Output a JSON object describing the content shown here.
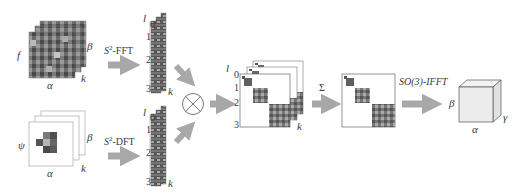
{
  "diagram": {
    "input_signal": {
      "symbol": "f",
      "axes": {
        "x": "α",
        "y": "β",
        "depth": "k"
      }
    },
    "filter": {
      "symbol": "ψ",
      "axes": {
        "x": "α",
        "y": "β",
        "depth": "k"
      }
    },
    "transforms": {
      "signal_transform": {
        "prefix": "S",
        "sup": "2",
        "suffix": "-FFT"
      },
      "filter_transform": {
        "prefix": "S",
        "sup": "2",
        "suffix": "-DFT"
      },
      "sum_symbol": "Σ",
      "inverse_transform": "SO(3)-IFFT"
    },
    "spectral_columns": {
      "degree_label": "l",
      "degree_ticks": [
        "0",
        "1",
        "2",
        "3"
      ],
      "depth_label": "k"
    },
    "operator": {
      "symbol": "⊗",
      "name": "outer-product"
    },
    "block_matrix": {
      "degree_label": "l",
      "degree_ticks": [
        "0",
        "1",
        "2",
        "3"
      ],
      "depth_label": "k"
    },
    "output": {
      "axes": {
        "x": "α",
        "y": "β",
        "depth": "γ"
      }
    },
    "colors": {
      "arrow": "#a8a8a8",
      "grid_dark": "#4a4a4a",
      "grid_mid": "#7a7a7a",
      "grid_light": "#b9b9b9",
      "cube_face": "#ececec",
      "outline": "#555555"
    }
  }
}
